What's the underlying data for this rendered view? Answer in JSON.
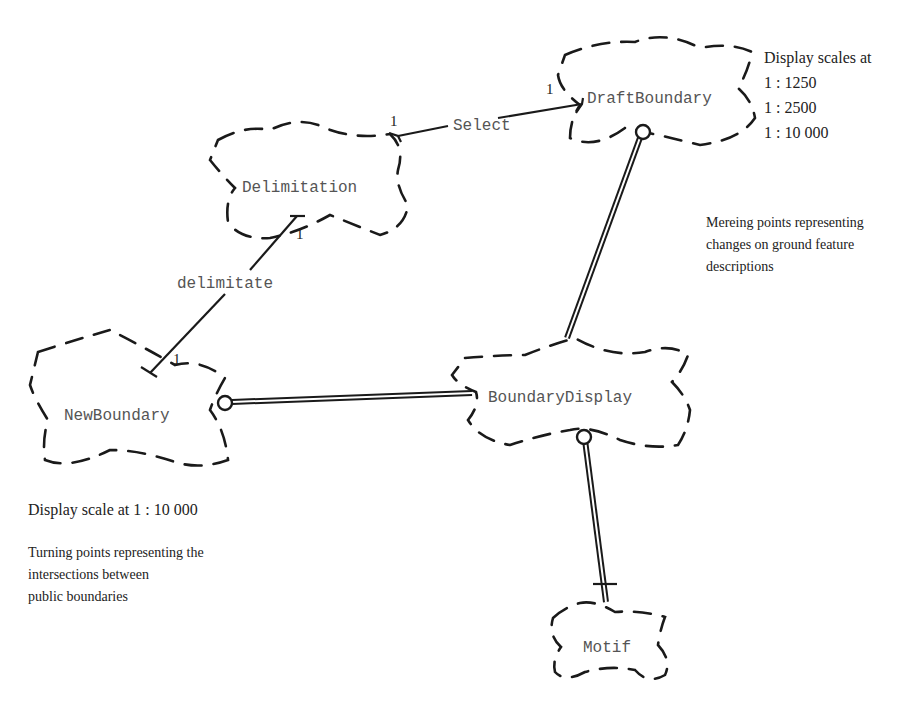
{
  "diagram": {
    "type": "class-diagram-clouds",
    "nodes": {
      "draft_boundary": {
        "label": "DraftBoundary"
      },
      "delimitation": {
        "label": "Delimitation"
      },
      "new_boundary": {
        "label": "NewBoundary"
      },
      "boundary_display": {
        "label": "BoundaryDisplay"
      },
      "motif": {
        "label": "Motif"
      }
    },
    "relations": {
      "select": {
        "label": "Select",
        "multiplicity_from": "1",
        "multiplicity_to": "1"
      },
      "delimitate": {
        "label": "delimitate",
        "multiplicity_from": "1",
        "multiplicity_to": "1"
      }
    },
    "notes": {
      "draft_scales": {
        "title": "Display scales at",
        "lines": [
          "1 : 1250",
          "1 : 2500",
          "1 : 10 000"
        ]
      },
      "mereing": {
        "lines": [
          "Mereing points representing",
          "changes on ground feature",
          "descriptions"
        ]
      },
      "new_scale": {
        "text": "Display scale at 1 : 10 000"
      },
      "turning": {
        "lines": [
          "Turning points representing the",
          "intersections between",
          "public boundaries"
        ]
      }
    }
  }
}
